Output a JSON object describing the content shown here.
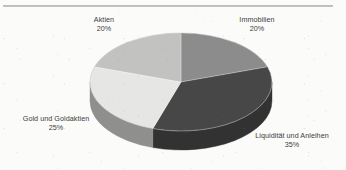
{
  "figure": {
    "background_color": "#fbfbfa",
    "rule_color": "#b3b3b3",
    "text_color": "#3b3b3b"
  },
  "chart_data": {
    "type": "pie",
    "title": "",
    "subtitle": "",
    "xlabel": "",
    "ylabel": "",
    "three_d": true,
    "legend_position": "none",
    "labels_position": "outside",
    "grid": false,
    "total": 100,
    "unit": "%",
    "categories": [
      "Immobilien",
      "Liquidität und Anleihen",
      "Gold und Goldaktien",
      "Aktien"
    ],
    "values": [
      20,
      35,
      25,
      20
    ],
    "colors": [
      "#8c8c8c",
      "#474747",
      "#e6e6e4",
      "#c2c2c0"
    ],
    "slices": [
      {
        "name": "Immobilien",
        "value": 20,
        "value_text": "20%",
        "color": "#8c8c8c",
        "side_color": "#6e6e6e",
        "start_deg": 0,
        "end_deg": 72
      },
      {
        "name": "Liquidität und Anleihen",
        "value": 35,
        "value_text": "35%",
        "color": "#474747",
        "side_color": "#323232",
        "start_deg": 72,
        "end_deg": 198
      },
      {
        "name": "Gold und Goldaktien",
        "value": 25,
        "value_text": "25%",
        "color": "#e6e6e4",
        "side_color": "#8f8f8d",
        "start_deg": 198,
        "end_deg": 288
      },
      {
        "name": "Aktien",
        "value": 20,
        "value_text": "20%",
        "color": "#c2c2c0",
        "side_color": "#9a9a98",
        "start_deg": 288,
        "end_deg": 360
      }
    ]
  },
  "labels": {
    "aktien": {
      "name": "Aktien",
      "percent": "20%"
    },
    "immobilien": {
      "name": "Immobilien",
      "percent": "20%"
    },
    "gold": {
      "name": "Gold und Goldaktien",
      "percent": "25%"
    },
    "liquiditaet": {
      "name": "Liquidität und Anleihen",
      "percent": "35%"
    }
  }
}
